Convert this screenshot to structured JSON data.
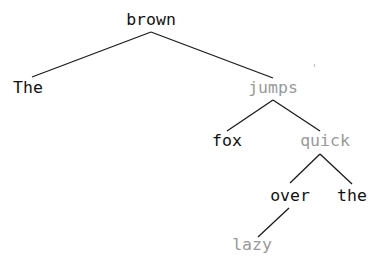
{
  "diagram": {
    "type": "dependency-tree",
    "colors": {
      "dark_text": "#111111",
      "gray_text": "#999999",
      "edge": "#1a1a1a"
    },
    "nodes": {
      "brown": {
        "label": "brown",
        "tone": "dark"
      },
      "the_cap": {
        "label": "The",
        "tone": "dark"
      },
      "jumps": {
        "label": "jumps",
        "tone": "gray"
      },
      "fox": {
        "label": "fox",
        "tone": "dark"
      },
      "quick": {
        "label": "quick",
        "tone": "gray"
      },
      "over": {
        "label": "over",
        "tone": "dark"
      },
      "the": {
        "label": "the",
        "tone": "dark"
      },
      "lazy": {
        "label": "lazy",
        "tone": "gray"
      }
    },
    "edges": [
      {
        "from": "brown",
        "to": "The"
      },
      {
        "from": "brown",
        "to": "jumps"
      },
      {
        "from": "jumps",
        "to": "fox"
      },
      {
        "from": "jumps",
        "to": "quick"
      },
      {
        "from": "quick",
        "to": "over"
      },
      {
        "from": "quick",
        "to": "the"
      },
      {
        "from": "over",
        "to": "lazy"
      }
    ]
  }
}
